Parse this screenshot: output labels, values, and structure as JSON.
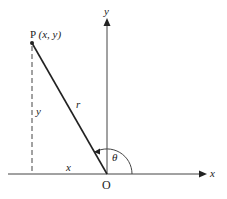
{
  "diagram": {
    "labels": {
      "point": "P",
      "point_coords": "(x, y)",
      "y_axis": "y",
      "x_axis": "x",
      "origin": "O",
      "radius": "r",
      "angle": "θ",
      "horizontal_leg": "x",
      "vertical_leg": "y"
    },
    "colors": {
      "stroke": "#222222",
      "background": "#ffffff"
    }
  }
}
